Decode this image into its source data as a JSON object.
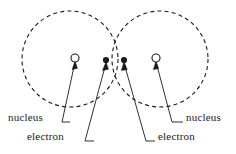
{
  "figure": {
    "background_color": "#ffffff",
    "stroke_color": "#1a1a1a",
    "text_color": "#1a1a1a"
  },
  "orbitals": [
    {
      "name": "left-orbital",
      "cx": 70,
      "cy": 59,
      "r": 48,
      "style": "dashed"
    },
    {
      "name": "right-orbital",
      "cx": 160,
      "cy": 59,
      "r": 48,
      "style": "dashed"
    }
  ],
  "nuclei": [
    {
      "name": "nucleus-left",
      "cx": 75,
      "cy": 58,
      "r": 4,
      "fill": "none"
    },
    {
      "name": "nucleus-right",
      "cx": 156,
      "cy": 58,
      "r": 4,
      "fill": "none"
    }
  ],
  "electrons": [
    {
      "name": "electron-left",
      "cx": 106,
      "cy": 60,
      "r": 3,
      "fill": "#1a1a1a"
    },
    {
      "name": "electron-right",
      "cx": 124,
      "cy": 60,
      "r": 3,
      "fill": "#1a1a1a"
    }
  ],
  "labels": {
    "nucleus_left": "nucleus",
    "electron_left": "electron",
    "nucleus_right": "nucleus",
    "electron_right": "electron"
  }
}
